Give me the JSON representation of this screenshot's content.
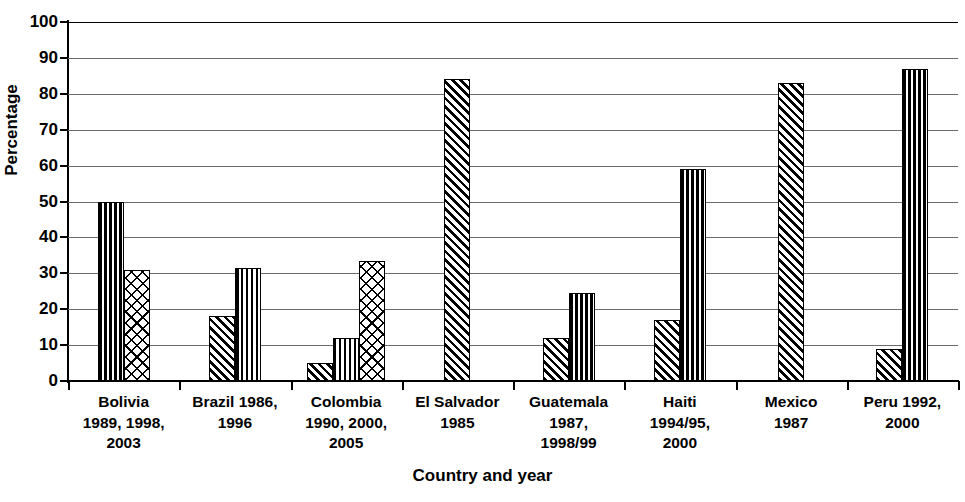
{
  "chart_data": {
    "type": "bar",
    "title": "",
    "xlabel": "Country and year",
    "ylabel": "Percentage",
    "ylim": [
      0,
      100
    ],
    "yticks": [
      0,
      10,
      20,
      30,
      40,
      50,
      60,
      70,
      80,
      90,
      100
    ],
    "grid": true,
    "legend": "none",
    "categories": [
      "Bolivia\n1989, 1998,\n2003",
      "Brazil 1986,\n1996",
      "Colombia\n1990, 2000,\n2005",
      "El Salvador\n1985",
      "Guatemala\n1987,\n1998/99",
      "Haiti\n1994/95,\n2000",
      "Mexico\n1987",
      "Peru 1992,\n2000"
    ],
    "series": [
      {
        "name": "series-1",
        "pattern": "diagonal-stripes",
        "values": [
          null,
          18,
          5,
          84,
          12,
          17,
          83,
          9
        ]
      },
      {
        "name": "series-2",
        "pattern": "checkerboard",
        "values": [
          50,
          31.5,
          12,
          null,
          24.5,
          59,
          null,
          87
        ]
      },
      {
        "name": "series-3",
        "pattern": "crosshatch",
        "values": [
          31,
          null,
          33.5,
          null,
          null,
          null,
          null,
          null
        ]
      }
    ],
    "bars": [
      {
        "category": "Bolivia 1989, 1998, 2003",
        "series": "series-2",
        "value": 50
      },
      {
        "category": "Bolivia 1989, 1998, 2003",
        "series": "series-3",
        "value": 31
      },
      {
        "category": "Brazil 1986, 1996",
        "series": "series-1",
        "value": 18
      },
      {
        "category": "Brazil 1986, 1996",
        "series": "series-2",
        "value": 31.5
      },
      {
        "category": "Colombia 1990, 2000, 2005",
        "series": "series-1",
        "value": 5
      },
      {
        "category": "Colombia 1990, 2000, 2005",
        "series": "series-2",
        "value": 12
      },
      {
        "category": "Colombia 1990, 2000, 2005",
        "series": "series-3",
        "value": 33.5
      },
      {
        "category": "El Salvador 1985",
        "series": "series-1",
        "value": 84
      },
      {
        "category": "Guatemala 1987, 1998/99",
        "series": "series-1",
        "value": 12
      },
      {
        "category": "Guatemala 1987, 1998/99",
        "series": "series-2",
        "value": 24.5
      },
      {
        "category": "Haiti 1994/95, 2000",
        "series": "series-1",
        "value": 17
      },
      {
        "category": "Haiti 1994/95, 2000",
        "series": "series-2",
        "value": 59
      },
      {
        "category": "Mexico 1987",
        "series": "series-1",
        "value": 83
      },
      {
        "category": "Peru 1992, 2000",
        "series": "series-1",
        "value": 9
      },
      {
        "category": "Peru 1992, 2000",
        "series": "series-2",
        "value": 87
      }
    ]
  },
  "axes": {
    "y_title": "Percentage",
    "x_title": "Country and year",
    "y_tick_labels": [
      "100",
      "90",
      "80",
      "70",
      "60",
      "50",
      "40",
      "30",
      "20",
      "10",
      "0"
    ]
  },
  "colors": {
    "axis": "#000000",
    "gridline": "#6b6b6b",
    "bar_fill": "#ffffff",
    "bar_stroke": "#000000",
    "background": "#ffffff"
  }
}
